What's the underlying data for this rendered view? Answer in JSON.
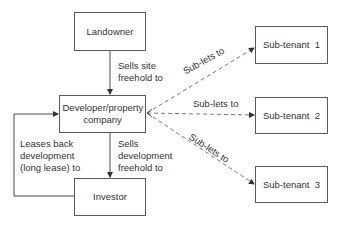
{
  "nodes": {
    "landowner": "Landowner",
    "developer": "Developer/property company",
    "investor": "Investor",
    "subtenant1": "Sub-tenant  1",
    "subtenant2": "Sub-tenant  2",
    "subtenant3": "Sub-tenant  3"
  },
  "edges": {
    "landowner_to_developer": {
      "line1": "Sells site",
      "line2": "freehold to"
    },
    "developer_to_investor": {
      "line1": "Sells",
      "line2": "development",
      "line3": "freehold to"
    },
    "investor_to_developer": {
      "line1": "Leases back",
      "line2": "development",
      "line3": "(long lease) to"
    },
    "developer_to_subtenant1": "Sub-lets to",
    "developer_to_subtenant2": "Sub-lets to",
    "developer_to_subtenant3": "Sub-lets to"
  },
  "colors": {
    "line": "#4a4a4a",
    "text": "#333333",
    "background": "#ffffff"
  }
}
